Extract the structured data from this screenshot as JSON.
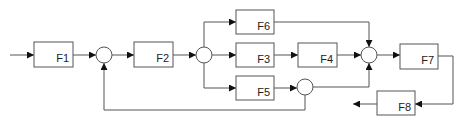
{
  "diagram": {
    "type": "block-diagram",
    "colors": {
      "stroke": "#555555",
      "text": "#222222",
      "background": "#ffffff"
    },
    "blocks": [
      {
        "id": "F1",
        "label": "F1"
      },
      {
        "id": "F2",
        "label": "F2"
      },
      {
        "id": "F3",
        "label": "F3"
      },
      {
        "id": "F4",
        "label": "F4"
      },
      {
        "id": "F5",
        "label": "F5"
      },
      {
        "id": "F6",
        "label": "F6"
      },
      {
        "id": "F7",
        "label": "F7"
      },
      {
        "id": "F8",
        "label": "F8"
      }
    ],
    "summing_junctions": [
      "S1",
      "S2",
      "S3",
      "S4"
    ],
    "connections": [
      "input -> F1",
      "F1 -> S1",
      "S1 -> F2",
      "F2 -> S2",
      "S2 -> F6",
      "S2 -> F3",
      "S2 -> F5",
      "F3 -> F4",
      "F5 -> S4",
      "F6 -> S3",
      "F4 -> S3",
      "S4 -> S3",
      "S4 -> S1 (feedback)",
      "S3 -> F7",
      "F7 -> F8",
      "F8 -> output"
    ]
  }
}
